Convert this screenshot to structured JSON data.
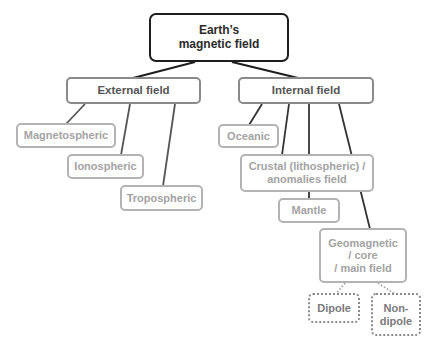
{
  "diagram": {
    "type": "tree",
    "root": {
      "label": "Earth's\nmagnetic field"
    },
    "nodes": {
      "root": "Earth’s magnetic field",
      "external": "External field",
      "internal": "Internal field",
      "magnetospheric": "Magnetospheric",
      "ionospheric": "Ionospheric",
      "tropospheric": "Tropospheric",
      "oceanic": "Oceanic",
      "crustal_line1": "Crustal (lithospheric) /",
      "crustal_line2": "anomalies field",
      "mantle": "Mantle",
      "geomagnetic_line1": "Geomagnetic",
      "geomagnetic_line2": "/ core",
      "geomagnetic_line3": "/ main field",
      "dipole": "Dipole",
      "nondipole_line1": "Non-",
      "nondipole_line2": "dipole",
      "root_line1": "Earth’s",
      "root_line2": "magnetic field"
    },
    "edges": [
      [
        "Earth's magnetic field",
        "External field"
      ],
      [
        "Earth's magnetic field",
        "Internal field"
      ],
      [
        "External field",
        "Magnetospheric"
      ],
      [
        "External field",
        "Ionospheric"
      ],
      [
        "External field",
        "Tropospheric"
      ],
      [
        "Internal field",
        "Oceanic"
      ],
      [
        "Internal field",
        "Crustal (lithospheric) / anomalies field"
      ],
      [
        "Internal field",
        "Mantle"
      ],
      [
        "Internal field",
        "Geomagnetic / core / main field"
      ],
      [
        "Geomagnetic / core / main field",
        "Dipole",
        "dotted"
      ],
      [
        "Geomagnetic / core / main field",
        "Non-dipole",
        "dotted"
      ]
    ],
    "colors": {
      "root_border": "#1e1e1e",
      "level1_border": "#8a8a8a",
      "level2_border": "#b3b3b3",
      "level2_text": "#a3a3a3",
      "edge_solid": "#2a2a2a",
      "edge_dotted": "#9a9a9a"
    }
  }
}
